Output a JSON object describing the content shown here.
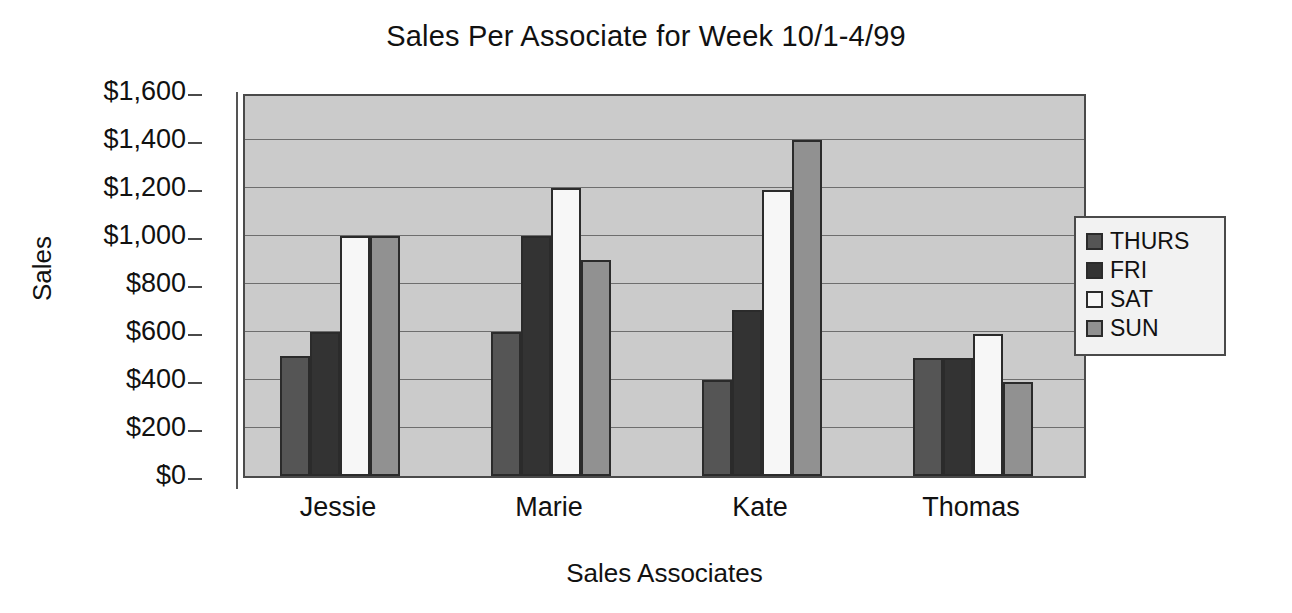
{
  "chart_data": {
    "type": "bar",
    "title": "Sales Per Associate for Week 10/1-4/99",
    "xlabel": "Sales Associates",
    "ylabel": "Sales",
    "categories": [
      "Jessie",
      "Marie",
      "Kate",
      "Thomas"
    ],
    "series": [
      {
        "name": "THURS",
        "color": "#555555",
        "values": [
          500,
          600,
          400,
          490
        ]
      },
      {
        "name": "FRI",
        "color": "#333333",
        "values": [
          600,
          1000,
          690,
          490
        ]
      },
      {
        "name": "SAT",
        "color": "#f7f7f7",
        "values": [
          1000,
          1200,
          1190,
          590
        ]
      },
      {
        "name": "SUN",
        "color": "#919191",
        "values": [
          1000,
          900,
          1400,
          390
        ]
      }
    ],
    "ylim": [
      0,
      1600
    ],
    "ytick_values": [
      0,
      200,
      400,
      600,
      800,
      1000,
      1200,
      1400,
      1600
    ],
    "ytick_labels": [
      "$0",
      "$200",
      "$400",
      "$600",
      "$800",
      "$1,000",
      "$1,200",
      "$1,400",
      "$1,600"
    ],
    "grid": true,
    "legend_position": "right",
    "plot_background": "#cbcbcb",
    "legend_background": "#f2f2f2",
    "axis_color": "#4a4a4a"
  }
}
